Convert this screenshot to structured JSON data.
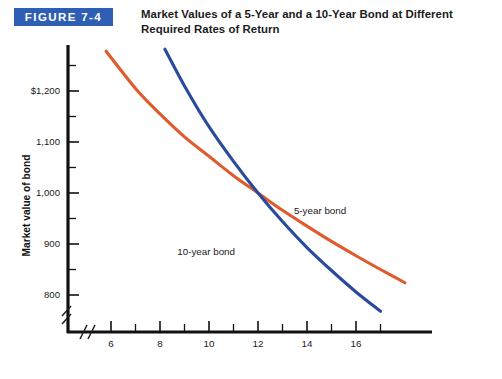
{
  "figure": {
    "badge_label": "FIGURE 7-4",
    "badge_color": "#2f5fb4",
    "title": "Market Values of a 5-Year and a 10-Year Bond at Different Required Rates of Return"
  },
  "chart_data": {
    "type": "line",
    "title": "Market Values of a 5-Year and a 10-Year Bond at Different Required Rates of Return",
    "xlabel": "Required rates of return (%)",
    "ylabel": "Market value of bond",
    "xlim": [
      5.0,
      18.2
    ],
    "ylim": [
      740,
      1300
    ],
    "xticks": [
      6,
      8,
      10,
      12,
      14,
      16
    ],
    "xtick_labels": [
      "6",
      "8",
      "10",
      "12",
      "14",
      "16"
    ],
    "xminor_ticks": [
      7,
      9,
      11,
      13,
      15,
      17
    ],
    "yticks": [
      800,
      900,
      1000,
      1100,
      1200
    ],
    "ytick_labels": [
      "800",
      "900",
      "1,000",
      "1,100",
      "$1,200"
    ],
    "yminor_ticks": [
      850,
      950,
      1050,
      1150,
      1250
    ],
    "grid": false,
    "legend_position": "inline-annotations",
    "axis_break": true,
    "crossing_point": {
      "x": 12,
      "y": 1000
    },
    "series": [
      {
        "name": "5-year bond",
        "color": "#df5b2c",
        "label_x": 14.2,
        "label_y": 962,
        "x": [
          5.8,
          7.0,
          8.0,
          9.0,
          10.0,
          11.0,
          12.0,
          13.0,
          14.0,
          15.0,
          16.0,
          17.0,
          18.0
        ],
        "values": [
          1278,
          1205,
          1155,
          1110,
          1072,
          1034,
          1000,
          966,
          935,
          905,
          877,
          850,
          824
        ]
      },
      {
        "name": "10-year bond",
        "color": "#2a4b9b",
        "label_x": 10.5,
        "label_y": 882,
        "x": [
          8.2,
          9.0,
          10.0,
          11.0,
          12.0,
          13.0,
          14.0,
          15.0,
          16.0,
          17.0
        ],
        "values": [
          1282,
          1210,
          1130,
          1062,
          1000,
          944,
          893,
          848,
          806,
          768
        ]
      }
    ]
  }
}
